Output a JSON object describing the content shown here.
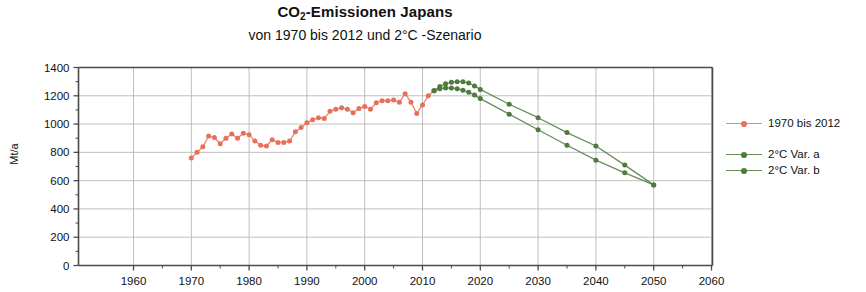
{
  "chart_data": {
    "type": "line",
    "title": "CO2-Emissionen Japans",
    "title_main": "CO",
    "title_sub": "2",
    "title_rest": "-Emissionen Japans",
    "subtitle": "von 1970 bis 2012 und 2°C -Szenario",
    "xlabel": "",
    "ylabel": "Mt/a",
    "xlim": [
      1960,
      2060
    ],
    "ylim": [
      0,
      1400
    ],
    "xticks": [
      1960,
      1970,
      1980,
      1990,
      2000,
      2010,
      2020,
      2030,
      2040,
      2050,
      2060
    ],
    "yticks": [
      0,
      200,
      400,
      600,
      800,
      1000,
      1200,
      1400
    ],
    "grid": "horizontal and vertical gridlines at major ticks",
    "legend_position": "right",
    "colors": {
      "historical": "#E8705A",
      "scenario_a": "#4F7A3E",
      "scenario_b": "#4F7A3E",
      "grid": "#b8b8b8",
      "axis": "#4a4a4a"
    },
    "series": [
      {
        "name": "1970 bis 2012",
        "color": "#E8705A",
        "marker": "circle",
        "x": [
          1970,
          1971,
          1972,
          1973,
          1974,
          1975,
          1976,
          1977,
          1978,
          1979,
          1980,
          1981,
          1982,
          1983,
          1984,
          1985,
          1986,
          1987,
          1988,
          1989,
          1990,
          1991,
          1992,
          1993,
          1994,
          1995,
          1996,
          1997,
          1998,
          1999,
          2000,
          2001,
          2002,
          2003,
          2004,
          2005,
          2006,
          2007,
          2008,
          2009,
          2010,
          2011,
          2012
        ],
        "values": [
          760,
          800,
          840,
          915,
          905,
          860,
          900,
          930,
          900,
          935,
          925,
          880,
          850,
          845,
          890,
          870,
          870,
          880,
          945,
          975,
          1010,
          1030,
          1045,
          1040,
          1090,
          1105,
          1115,
          1105,
          1080,
          1110,
          1125,
          1105,
          1150,
          1165,
          1165,
          1170,
          1155,
          1215,
          1155,
          1075,
          1135,
          1200,
          1235
        ]
      },
      {
        "name": "2°C Var. a",
        "color": "#4F7A3E",
        "marker": "circle",
        "x": [
          2012,
          2013,
          2014,
          2015,
          2016,
          2017,
          2018,
          2019,
          2020,
          2025,
          2030,
          2035,
          2040,
          2045,
          2050
        ],
        "values": [
          1235,
          1265,
          1285,
          1295,
          1300,
          1300,
          1290,
          1270,
          1245,
          1140,
          1045,
          940,
          845,
          710,
          570
        ]
      },
      {
        "name": "2°C Var. b",
        "color": "#4F7A3E",
        "marker": "circle",
        "x": [
          2012,
          2013,
          2014,
          2015,
          2016,
          2017,
          2018,
          2019,
          2020,
          2025,
          2030,
          2035,
          2040,
          2045,
          2050
        ],
        "values": [
          1235,
          1250,
          1255,
          1255,
          1250,
          1240,
          1225,
          1205,
          1180,
          1070,
          960,
          850,
          745,
          655,
          570
        ]
      }
    ]
  },
  "legend": {
    "items": [
      {
        "label": "1970 bis 2012",
        "color": "#E8705A",
        "gap": false
      },
      {
        "label": "2°C Var. a",
        "color": "#4F7A3E",
        "gap": true
      },
      {
        "label": "2°C Var. b",
        "color": "#4F7A3E",
        "gap": false
      }
    ]
  }
}
